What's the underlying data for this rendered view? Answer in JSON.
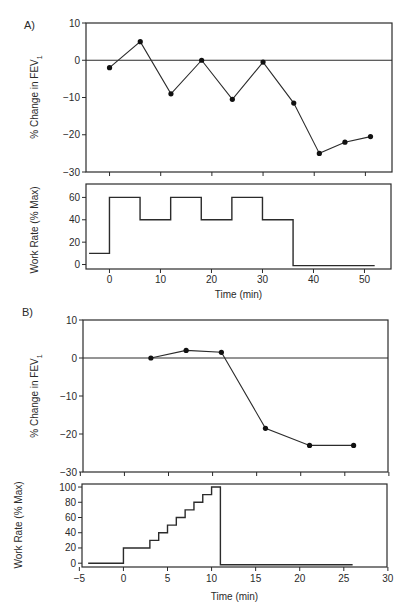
{
  "figure": {
    "panels": [
      {
        "label": "A)"
      },
      {
        "label": "B)"
      }
    ]
  },
  "chart_data": [
    {
      "panel": "A",
      "type": "line",
      "title": "",
      "xlabel": "",
      "ylabel": "% Change in FEV1",
      "ylabel_main": "% Change in FEV",
      "ylabel_sub": "1",
      "ylim": [
        -30,
        10
      ],
      "xlim": [
        -4.6,
        55.2
      ],
      "yticks": [
        10,
        0,
        -10,
        -20,
        -30
      ],
      "xticks": [
        0,
        10,
        20,
        30,
        40,
        50
      ],
      "reference_line_y": 0,
      "grid": false,
      "marker": "circle",
      "x": [
        0,
        6,
        12,
        18,
        24,
        30,
        36,
        41,
        46,
        51
      ],
      "values": [
        -2,
        5,
        -9,
        0,
        -10.5,
        -0.5,
        -11.5,
        -25,
        -22,
        -20.5
      ]
    },
    {
      "panel": "A",
      "type": "line",
      "subtype": "step",
      "title": "",
      "xlabel": "Time (min)",
      "ylabel": "Work Rate (% Max)",
      "ylim": [
        -4,
        72
      ],
      "xlim": [
        -4.6,
        55.2
      ],
      "yticks": [
        0,
        20,
        40,
        60
      ],
      "xticks": [
        0,
        10,
        20,
        30,
        40,
        50
      ],
      "xtick_labels": [
        "0",
        "10",
        "20",
        "30",
        "40",
        "50"
      ],
      "grid": false,
      "segments": [
        {
          "from": -4,
          "to": 0,
          "value": 10
        },
        {
          "from": 0,
          "to": 6,
          "value": 60
        },
        {
          "from": 6,
          "to": 12,
          "value": 40
        },
        {
          "from": 12,
          "to": 18,
          "value": 60
        },
        {
          "from": 18,
          "to": 24,
          "value": 40
        },
        {
          "from": 24,
          "to": 30,
          "value": 60
        },
        {
          "from": 30,
          "to": 36,
          "value": 40
        },
        {
          "from": 36,
          "to": 52,
          "value": -1
        }
      ]
    },
    {
      "panel": "B",
      "type": "line",
      "title": "",
      "xlabel": "",
      "ylabel": "% Change in FEV1",
      "ylabel_main": "% Change in FEV",
      "ylabel_sub": "1",
      "ylim": [
        -30,
        10
      ],
      "xlim": [
        -4.7,
        29.9
      ],
      "yticks": [
        10,
        0,
        -10,
        -20,
        -30
      ],
      "xticks": [
        -5,
        0,
        5,
        10,
        15,
        20,
        25,
        30
      ],
      "reference_line_y": 0,
      "grid": false,
      "marker": "circle",
      "x": [
        3,
        7,
        11,
        16,
        21,
        26
      ],
      "values": [
        0,
        2,
        1.5,
        -18.5,
        -23,
        -23
      ]
    },
    {
      "panel": "B",
      "type": "line",
      "subtype": "step",
      "title": "",
      "xlabel": "Time (min)",
      "ylabel": "Work Rate (% Max)",
      "ylim": [
        -5,
        104
      ],
      "xlim": [
        -4.7,
        29.9
      ],
      "yticks": [
        0,
        20,
        40,
        60,
        80,
        100
      ],
      "xticks": [
        -5,
        0,
        5,
        10,
        15,
        20,
        25,
        30
      ],
      "xtick_labels": [
        "−5",
        "0",
        "5",
        "10",
        "15",
        "20",
        "25",
        "30"
      ],
      "grid": false,
      "segments": [
        {
          "from": -4,
          "to": 0,
          "value": 0
        },
        {
          "from": 0,
          "to": 3,
          "value": 20
        },
        {
          "from": 3,
          "to": 4,
          "value": 30
        },
        {
          "from": 4,
          "to": 5,
          "value": 40
        },
        {
          "from": 5,
          "to": 6,
          "value": 50
        },
        {
          "from": 6,
          "to": 7,
          "value": 60
        },
        {
          "from": 7,
          "to": 8,
          "value": 70
        },
        {
          "from": 8,
          "to": 9,
          "value": 80
        },
        {
          "from": 9,
          "to": 10,
          "value": 90
        },
        {
          "from": 10,
          "to": 11,
          "value": 100
        },
        {
          "from": 11,
          "to": 26,
          "value": -2
        }
      ]
    }
  ]
}
